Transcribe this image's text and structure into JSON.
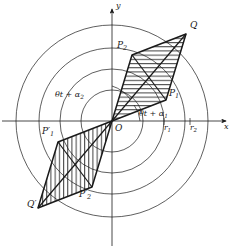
{
  "figure": {
    "background_color": "#ffffff",
    "stroke_color": "#1a1a1a",
    "hatch_color": "#1a1a1a",
    "axes": {
      "x_label": "x",
      "y_label": "y",
      "origin_label": "O",
      "origin_x": 112,
      "origin_y": 121,
      "x_axis_y": 121,
      "y_axis_x": 112,
      "x_arrow_end": 229,
      "y_arrow_end": 6
    },
    "circles": [
      {
        "name": "circle-1",
        "radius": 31
      },
      {
        "name": "circle-2",
        "radius": 52
      },
      {
        "name": "circle-3",
        "radius": 73
      },
      {
        "name": "circle-4",
        "radius": 96
      }
    ],
    "ticks": [
      {
        "name": "tick-r1",
        "label": "r",
        "sub": "1",
        "x": 166,
        "y": 128
      },
      {
        "name": "tick-r2",
        "label": "r",
        "sub": "2",
        "x": 192,
        "y": 128
      }
    ],
    "angle_labels": [
      {
        "name": "angle-theta-t-alpha-2",
        "text": "θt + α",
        "sub": "2",
        "x": 55,
        "y": 96
      },
      {
        "name": "angle-theta-t-alpha-1",
        "text": "θt + α",
        "sub": "1",
        "x": 139,
        "y": 114
      }
    ],
    "points": [
      {
        "name": "point-Q",
        "label": "Q",
        "prime": false,
        "sub": "",
        "px": 186,
        "py": 34,
        "lx": 190,
        "ly": 25
      },
      {
        "name": "point-P2",
        "label": "P",
        "prime": false,
        "sub": "2",
        "px": 132,
        "py": 55,
        "lx": 118,
        "ly": 44
      },
      {
        "name": "point-P1",
        "label": "P",
        "prime": false,
        "sub": "1",
        "px": 166,
        "py": 100,
        "lx": 169,
        "ly": 92
      },
      {
        "name": "point-P1p",
        "label": "P",
        "prime": true,
        "sub": "1",
        "px": 58,
        "py": 142,
        "lx": 44,
        "ly": 130
      },
      {
        "name": "point-Q2p",
        "label": "Q",
        "prime": true,
        "sub": "",
        "px": 38,
        "py": 208,
        "lx": 30,
        "ly": 204
      },
      {
        "name": "point-P2p",
        "label": "P",
        "prime": true,
        "sub": "2",
        "px": 92,
        "py": 187,
        "lx": 80,
        "ly": 193
      }
    ],
    "parallelograms": [
      {
        "name": "upper-parallelogram",
        "vertices": "O,P1,Q,P2",
        "hatch": "horizontal",
        "points": "112,121 166,100 186,34 132,55"
      },
      {
        "name": "lower-parallelogram",
        "vertices": "O,P1prime,Qprime,P2prime",
        "hatch": "vertical",
        "points": "112,121 58,142 38,208 92,187"
      }
    ],
    "diagonals": [
      {
        "name": "diagonal-O-Q",
        "x1": 112,
        "y1": 121,
        "x2": 186,
        "y2": 34
      },
      {
        "name": "diagonal-P1-P2",
        "x1": 166,
        "y1": 100,
        "x2": 132,
        "y2": 55
      },
      {
        "name": "diagonal-O-Qprime",
        "x1": 112,
        "y1": 121,
        "x2": 38,
        "y2": 208
      },
      {
        "name": "diagonal-P1p-P2p",
        "x1": 58,
        "y1": 142,
        "x2": 92,
        "y2": 187
      }
    ]
  }
}
